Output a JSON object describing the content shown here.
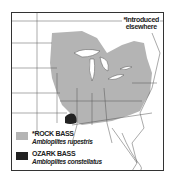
{
  "map": {
    "region": "Eastern United States and southern Canada",
    "note": {
      "line1": "*Introduced",
      "line2": "elsewhere"
    },
    "colors": {
      "rock_bass": "#b4b4b4",
      "ozark_bass": "#222222",
      "border": "#333333",
      "lines": "#555555"
    },
    "legend": [
      {
        "name": "*ROCK BASS",
        "scientific": "Ambloplites rupestris",
        "swatch_color": "#b4b4b4"
      },
      {
        "name": "OZARK BASS",
        "scientific": "Ambloplites constellatus",
        "swatch_color": "#222222"
      }
    ]
  }
}
